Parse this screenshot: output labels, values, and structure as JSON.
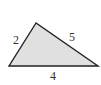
{
  "diagram": {
    "type": "triangle",
    "fill_color": "#e0e0e0",
    "stroke_color": "#222222",
    "vertices": {
      "apex": [
        36,
        23
      ],
      "bottom_left": [
        9,
        66
      ],
      "bottom_right": [
        98,
        66
      ]
    },
    "side_labels": {
      "left": "2",
      "right": "5",
      "bottom": "4"
    }
  }
}
